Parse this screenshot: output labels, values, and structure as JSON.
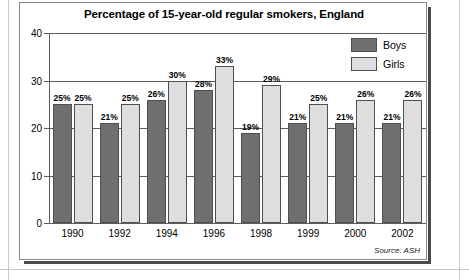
{
  "figure": {
    "title": "Percentage of 15-year-old regular smokers, England",
    "source": "Source: ASH"
  },
  "legend": {
    "items": [
      {
        "label": "Boys",
        "color": "#6f6f6f"
      },
      {
        "label": "Girls",
        "color": "#dedede"
      }
    ]
  },
  "axis": {
    "y_ticks": [
      "0",
      "10",
      "20",
      "30",
      "40"
    ],
    "x_ticks": [
      "1990",
      "1992",
      "1994",
      "1996",
      "1998",
      "1999",
      "2000",
      "2002"
    ]
  },
  "bar_labels": {
    "boys": [
      "25%",
      "21%",
      "26%",
      "28%",
      "19%",
      "21%",
      "21%",
      "21%"
    ],
    "girls": [
      "25%",
      "25%",
      "30%",
      "33%",
      "29%",
      "25%",
      "26%",
      "26%"
    ]
  },
  "chart_data": {
    "type": "bar",
    "title": "Percentage of 15-year-old regular smokers, England",
    "xlabel": "",
    "ylabel": "",
    "categories": [
      "1990",
      "1992",
      "1994",
      "1996",
      "1998",
      "1999",
      "2000",
      "2002"
    ],
    "series": [
      {
        "name": "Boys",
        "values": [
          25,
          21,
          26,
          28,
          19,
          21,
          21,
          21
        ],
        "color": "#6f6f6f"
      },
      {
        "name": "Girls",
        "values": [
          25,
          25,
          30,
          33,
          29,
          25,
          26,
          26
        ],
        "color": "#dedede"
      }
    ],
    "ylim": [
      0,
      40
    ],
    "yticks": [
      0,
      10,
      20,
      30,
      40
    ],
    "grid": true,
    "data_labels": true,
    "data_label_suffix": "%",
    "legend_position": "top-right",
    "annotations": [
      "Source: ASH"
    ]
  }
}
